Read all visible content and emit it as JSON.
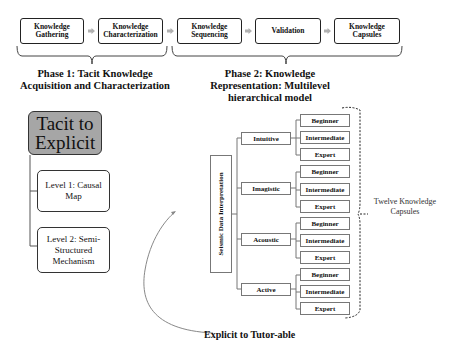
{
  "pipeline": {
    "steps": [
      {
        "label": "Knowledge Gathering",
        "left": 20,
        "width": 64
      },
      {
        "label": "Knowledge Characterization",
        "left": 98,
        "width": 65
      },
      {
        "label": "Knowledge Sequencing",
        "left": 177,
        "width": 65
      },
      {
        "label": "Validation",
        "left": 255,
        "width": 66
      },
      {
        "label": "Knowledge Capsules",
        "left": 334,
        "width": 66
      }
    ],
    "arrow_color": "#b0b0b0"
  },
  "phases": {
    "phase1": "Phase 1: Tacit Knowledge Acquisition and Characterization",
    "phase2": "Phase 2: Knowledge Representation: Multilevel hierarchical model"
  },
  "tacit": {
    "root_label": "Tacit to Explicit",
    "root_color": "#a6a6a6",
    "levels": [
      {
        "label": "Level 1: Causal Map"
      },
      {
        "label": "Level 2: Semi-Structured Mechanism"
      }
    ]
  },
  "hierarchy": {
    "root": "Seismic Data Interpretation",
    "categories": [
      {
        "label": "Intuitive",
        "levels": [
          "Beginner",
          "Intermediate",
          "Expert"
        ]
      },
      {
        "label": "Imagistic",
        "levels": [
          "Beginner",
          "Intermediate",
          "Expert"
        ]
      },
      {
        "label": "Acoustic",
        "levels": [
          "Beginner",
          "Intermediate",
          "Expert"
        ]
      },
      {
        "label": "Active",
        "levels": [
          "Beginner",
          "Intermediate",
          "Expert"
        ]
      }
    ],
    "capsules_note": "Twelve Knowledge Capsules"
  },
  "bottom_label": "Explicit to Tutor-able"
}
